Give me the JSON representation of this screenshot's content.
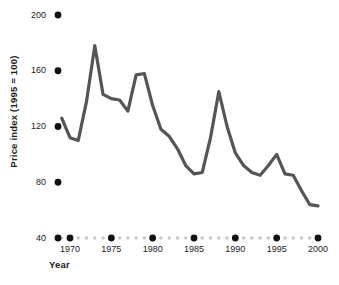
{
  "chart_data": {
    "type": "line",
    "title": "",
    "xlabel": "Year",
    "ylabel": "Price index (1995 = 100)",
    "xlim": [
      1969,
      2000
    ],
    "ylim": [
      40,
      200
    ],
    "ytick_labels": [
      "200",
      "160",
      "120",
      "80",
      "40"
    ],
    "ytick_values": [
      200,
      160,
      120,
      80,
      40
    ],
    "xtick_labels": [
      "1970",
      "1975",
      "1980",
      "1985",
      "1990",
      "1995",
      "2000"
    ],
    "xtick_values": [
      1970,
      1975,
      1980,
      1985,
      1990,
      1995,
      2000
    ],
    "minor_xtick_values": [
      1969,
      1971,
      1972,
      1973,
      1974,
      1976,
      1977,
      1978,
      1979,
      1981,
      1982,
      1983,
      1984,
      1986,
      1987,
      1988,
      1989,
      1991,
      1992,
      1993,
      1994,
      1996,
      1997,
      1998,
      1999
    ],
    "grid": false,
    "legend": "none",
    "axis_style": "dotted-markers",
    "series": [
      {
        "name": "Price index",
        "color": "#555555",
        "x": [
          1969,
          1970,
          1971,
          1972,
          1973,
          1974,
          1975,
          1976,
          1977,
          1978,
          1979,
          1980,
          1981,
          1982,
          1983,
          1984,
          1985,
          1986,
          1987,
          1988,
          1989,
          1990,
          1991,
          1992,
          1993,
          1994,
          1995,
          1996,
          1997,
          1998,
          1999,
          2000
        ],
        "values": [
          126,
          112,
          110,
          138,
          178,
          143,
          140,
          139,
          131,
          157,
          158,
          135,
          118,
          113,
          104,
          92,
          86,
          87,
          112,
          145,
          120,
          101,
          92,
          87,
          85,
          92,
          100,
          86,
          85,
          74,
          64,
          63
        ]
      }
    ]
  },
  "axis_markers": {
    "major_dot_color": "#111111",
    "minor_dot_color": "#c8c8c8",
    "origin_label": "40"
  }
}
